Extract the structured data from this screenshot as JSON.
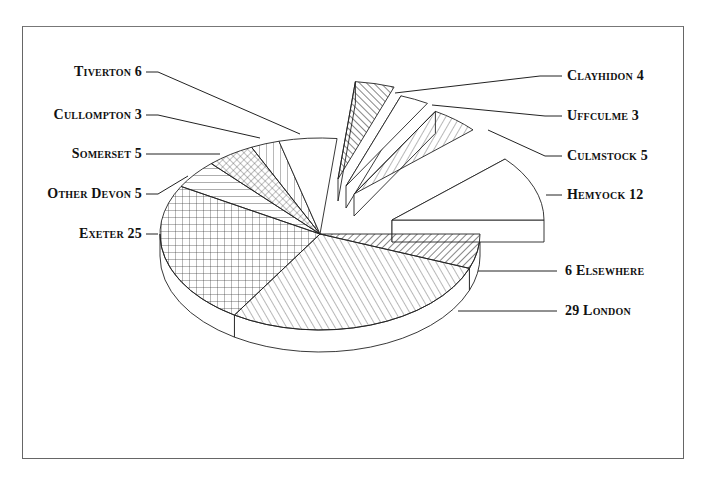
{
  "chart_data": {
    "type": "pie",
    "style": "3d-exploded",
    "title": "",
    "slices": [
      {
        "label": "6 Elsewhere",
        "name": "Elsewhere",
        "value": 6,
        "pattern": "diag-dense",
        "exploded": false
      },
      {
        "label": "29 London",
        "name": "London",
        "value": 29,
        "pattern": "diag-back",
        "exploded": false
      },
      {
        "label": "Exeter 25",
        "name": "Exeter",
        "value": 25,
        "pattern": "grid",
        "exploded": false
      },
      {
        "label": "Other Devon 5",
        "name": "Other Devon",
        "value": 5,
        "pattern": "horizontal",
        "exploded": false
      },
      {
        "label": "Somerset 5",
        "name": "Somerset",
        "value": 5,
        "pattern": "crosshatch-diag",
        "exploded": false
      },
      {
        "label": "Cullompton 3",
        "name": "Cullompton",
        "value": 3,
        "pattern": "vertical",
        "exploded": false
      },
      {
        "label": "Tiverton 6",
        "name": "Tiverton",
        "value": 6,
        "pattern": "none",
        "exploded": false
      },
      {
        "label": "Clayhidon 4",
        "name": "Clayhidon",
        "value": 4,
        "pattern": "diag-back-dense",
        "exploded": true
      },
      {
        "label": "Uffculme 3",
        "name": "Uffculme",
        "value": 3,
        "pattern": "none",
        "exploded": true
      },
      {
        "label": "Culmstock 5",
        "name": "Culmstock",
        "value": 5,
        "pattern": "diag",
        "exploded": true
      },
      {
        "label": "Hemyock 12",
        "name": "Hemyock",
        "value": 12,
        "pattern": "none",
        "exploded": true
      }
    ],
    "total": 103,
    "legend": "none (leader-line labels)"
  },
  "labels": {
    "tiverton": "Tiverton 6",
    "cullompton": "Cullompton 3",
    "somerset": "Somerset 5",
    "other_devon": "Other Devon 5",
    "exeter": "Exeter 25",
    "clayhidon": "Clayhidon 4",
    "uffculme": "Uffculme 3",
    "culmstock": "Culmstock 5",
    "hemyock": "Hemyock 12",
    "elsewhere": "6 Elsewhere",
    "london": "29 London"
  },
  "colors": {
    "ink": "#222222",
    "frame": "#666666",
    "background": "#ffffff"
  }
}
